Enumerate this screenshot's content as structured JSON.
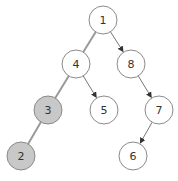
{
  "diagram": {
    "type": "binary-tree",
    "colors": {
      "background": "#ffffff",
      "node_fill": "#ffffff",
      "node_fill_highlight": "#c8c8c8",
      "node_stroke": "#8a8a8a",
      "edge": "#777777",
      "edge_highlight": "#9a9a9a",
      "label": "#333333"
    },
    "radius": 14,
    "nodes": [
      {
        "id": "1",
        "label": "1",
        "x": 103,
        "y": 20,
        "highlighted": false
      },
      {
        "id": "4",
        "label": "4",
        "x": 76,
        "y": 64,
        "highlighted": false
      },
      {
        "id": "8",
        "label": "8",
        "x": 131,
        "y": 64,
        "highlighted": false
      },
      {
        "id": "3",
        "label": "3",
        "x": 48,
        "y": 110,
        "highlighted": true
      },
      {
        "id": "5",
        "label": "5",
        "x": 104,
        "y": 110,
        "highlighted": false
      },
      {
        "id": "7",
        "label": "7",
        "x": 159,
        "y": 110,
        "highlighted": false
      },
      {
        "id": "2",
        "label": "2",
        "x": 21,
        "y": 156,
        "highlighted": true
      },
      {
        "id": "6",
        "label": "6",
        "x": 133,
        "y": 156,
        "highlighted": false
      }
    ],
    "edges": [
      {
        "from": "1",
        "to": "4",
        "highlighted": true,
        "arrow": false
      },
      {
        "from": "1",
        "to": "8",
        "highlighted": false,
        "arrow": true
      },
      {
        "from": "4",
        "to": "3",
        "highlighted": true,
        "arrow": false
      },
      {
        "from": "4",
        "to": "5",
        "highlighted": false,
        "arrow": true
      },
      {
        "from": "8",
        "to": "7",
        "highlighted": false,
        "arrow": true
      },
      {
        "from": "3",
        "to": "2",
        "highlighted": true,
        "arrow": false
      },
      {
        "from": "7",
        "to": "6",
        "highlighted": false,
        "arrow": true
      }
    ]
  }
}
